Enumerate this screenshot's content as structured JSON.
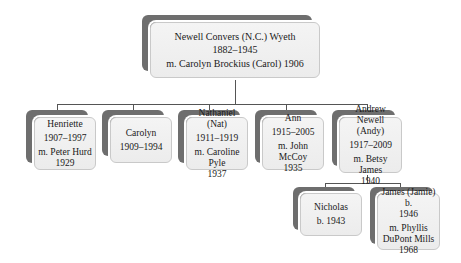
{
  "diagram": {
    "type": "family-tree",
    "colors": {
      "back_box": "#6e6e6e",
      "front_box": "#efefef",
      "front_border": "#c9c9c9",
      "connector": "#555555"
    },
    "root": {
      "name": "Newell Convers (N.C.) Wyeth",
      "dates": "1882–1945",
      "marriage": "m. Carolyn Brockius (Carol) 1906"
    },
    "children": [
      {
        "name": "Henriette",
        "dates": "1907–1997",
        "marriage_1": "m. Peter Hurd",
        "marriage_2": "1929"
      },
      {
        "name": "Carolyn",
        "dates": "1909–1994"
      },
      {
        "name": "Nathaniel (Nat)",
        "dates": "1911–1919",
        "marriage_1": "m. Caroline Pyle",
        "marriage_2": "1937"
      },
      {
        "name": "Ann",
        "dates": "1915–2005",
        "marriage_1": "m. John McCoy",
        "marriage_2": "1935"
      },
      {
        "name_1": "Andrew Newell",
        "name_2": "(Andy)",
        "dates": "1917–2009",
        "marriage_1": "m. Betsy James",
        "marriage_2": "1940"
      }
    ],
    "grandchildren": [
      {
        "name": "Nicholas",
        "dates": "b. 1943"
      },
      {
        "name_1": "James (Jamie) b.",
        "name_2": "1946",
        "marriage_1": "m. Phyllis",
        "marriage_2": "DuPont Mills",
        "marriage_3": "1968"
      }
    ]
  }
}
